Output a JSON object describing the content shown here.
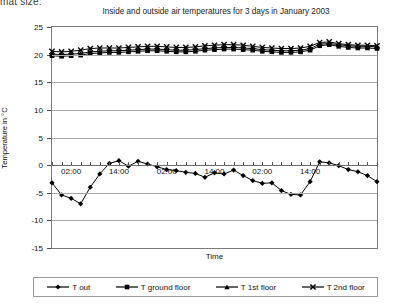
{
  "page": {
    "clipped_text": "mat size:"
  },
  "axis": {
    "y_title": "Temperature in °C",
    "x_title": "Time",
    "y_ticks": [
      25,
      20,
      15,
      10,
      5,
      0,
      -5,
      -10,
      -15
    ],
    "x_tick_labels": [
      "02:00",
      "14:00",
      "02:00",
      "14:00",
      "02:00",
      "14:00"
    ],
    "x_tick_label_positions": [
      2,
      7,
      12,
      17,
      22,
      27
    ]
  },
  "legend": {
    "items": [
      {
        "label": "T out",
        "marker": "diamond",
        "color": "#000000"
      },
      {
        "label": "T ground floor",
        "marker": "square",
        "color": "#000000"
      },
      {
        "label": "T 1st floor",
        "marker": "triangle",
        "color": "#000000"
      },
      {
        "label": "T 2nd floor",
        "marker": "cross",
        "color": "#000000"
      }
    ]
  },
  "chart_data": {
    "type": "line",
    "title": "Inside and outside air temperatures for 3 days in January 2003",
    "xlabel": "Time",
    "ylabel": "Temperature in °C",
    "ylim": [
      -15,
      25
    ],
    "ytick_step": 5,
    "grid": true,
    "legend_position": "bottom",
    "x": [
      "00:00",
      "02:00",
      "04:00",
      "06:00",
      "08:00",
      "10:00",
      "12:00",
      "14:00",
      "16:00",
      "18:00",
      "20:00",
      "22:00",
      "00:00",
      "02:00",
      "04:00",
      "06:00",
      "08:00",
      "10:00",
      "12:00",
      "14:00",
      "16:00",
      "18:00",
      "20:00",
      "22:00",
      "00:00",
      "02:00",
      "04:00",
      "06:00",
      "08:00",
      "10:00",
      "12:00",
      "14:00",
      "16:00",
      "18:00",
      "20:00"
    ],
    "xlabels_shown": [
      "02:00",
      "14:00",
      "02:00",
      "14:00",
      "02:00",
      "14:00"
    ],
    "series": [
      {
        "name": "T out",
        "marker": "diamond",
        "color": "#000000",
        "values": [
          -3.2,
          -5.4,
          -6.0,
          -7.0,
          -4.0,
          -1.6,
          0.3,
          0.8,
          -0.2,
          0.7,
          0.2,
          -0.3,
          -0.8,
          -1.0,
          -1.3,
          -1.5,
          -2.2,
          -1.4,
          -1.6,
          -0.9,
          -1.9,
          -2.8,
          -3.3,
          -3.2,
          -4.6,
          -5.3,
          -5.4,
          -3.0,
          0.6,
          0.4,
          -0.1,
          -0.8,
          -1.2,
          -1.9,
          -3.0
        ]
      },
      {
        "name": "T ground floor",
        "marker": "square",
        "color": "#000000",
        "values": [
          19.8,
          19.7,
          19.8,
          19.9,
          20.2,
          20.3,
          20.4,
          20.4,
          20.5,
          20.6,
          20.7,
          20.7,
          20.6,
          20.5,
          20.5,
          20.6,
          20.8,
          20.9,
          21.0,
          21.0,
          20.9,
          20.8,
          20.6,
          20.5,
          20.4,
          20.4,
          20.5,
          20.8,
          21.6,
          21.8,
          21.5,
          21.3,
          21.2,
          21.2,
          21.1
        ]
      },
      {
        "name": "T 1st floor",
        "marker": "triangle",
        "color": "#000000",
        "values": [
          20.1,
          20.0,
          20.1,
          20.2,
          20.5,
          20.6,
          20.7,
          20.7,
          20.8,
          20.9,
          21.0,
          21.0,
          20.9,
          20.8,
          20.8,
          20.9,
          21.1,
          21.2,
          21.3,
          21.3,
          21.2,
          21.1,
          20.9,
          20.8,
          20.7,
          20.7,
          20.8,
          21.1,
          21.9,
          22.0,
          21.8,
          21.6,
          21.5,
          21.5,
          21.4
        ]
      },
      {
        "name": "T 2nd floor",
        "marker": "cross",
        "color": "#000000",
        "values": [
          20.6,
          20.5,
          20.6,
          20.8,
          21.1,
          21.2,
          21.2,
          21.2,
          21.3,
          21.4,
          21.5,
          21.5,
          21.4,
          21.3,
          21.3,
          21.4,
          21.6,
          21.7,
          21.8,
          21.8,
          21.7,
          21.5,
          21.3,
          21.2,
          21.1,
          21.1,
          21.2,
          21.5,
          22.2,
          22.3,
          22.0,
          21.8,
          21.7,
          21.7,
          21.6
        ]
      }
    ]
  }
}
